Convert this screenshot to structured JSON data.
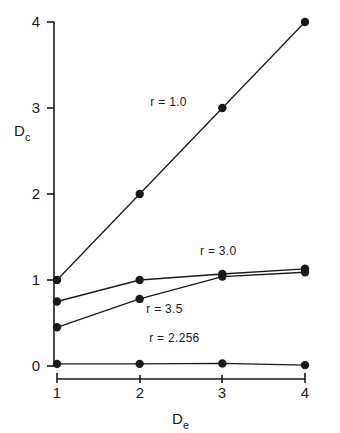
{
  "chart_data": {
    "type": "line",
    "title": "",
    "xlabel": "D_e",
    "ylabel": "D_c",
    "xlabel_base": "D",
    "xlabel_sub": "e",
    "ylabel_base": "D",
    "ylabel_sub": "c",
    "x": [
      1,
      2,
      3,
      4
    ],
    "xlim": [
      1,
      4
    ],
    "ylim": [
      0,
      4
    ],
    "xticks": [
      1,
      2,
      3,
      4
    ],
    "yticks": [
      0,
      1,
      2,
      3,
      4
    ],
    "xtick_labels": [
      "1",
      "2",
      "3",
      "4"
    ],
    "ytick_labels": [
      "0",
      "1",
      "2",
      "3",
      "4"
    ],
    "grid": false,
    "legend_position": "inline-annotations",
    "series": [
      {
        "name": "r = 1.0",
        "label": "r = 1.0",
        "values": [
          1.0,
          2.0,
          3.0,
          4.0
        ],
        "annotation_x": 2.35,
        "annotation_y": 3.02
      },
      {
        "name": "r = 3.0",
        "label": "r = 3.0",
        "values": [
          0.75,
          1.0,
          1.07,
          1.13
        ],
        "annotation_x": 2.95,
        "annotation_y": 1.29
      },
      {
        "name": "r = 3.5",
        "label": "r = 3.5",
        "values": [
          0.45,
          0.78,
          1.04,
          1.09
        ],
        "annotation_x": 2.3,
        "annotation_y": 0.62
      },
      {
        "name": "r = 2.256",
        "label": "r = 2.256",
        "values": [
          0.025,
          0.025,
          0.03,
          0.01
        ],
        "annotation_x": 2.42,
        "annotation_y": 0.28
      }
    ],
    "colors": {
      "line": "#1a1a1a",
      "marker": "#1a1a1a",
      "axis": "#1a1a1a",
      "background": "#ffffff"
    }
  }
}
